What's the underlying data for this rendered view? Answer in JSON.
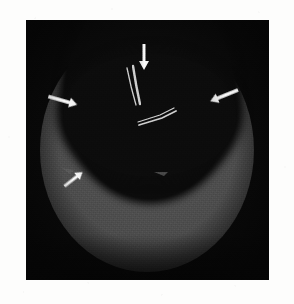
{
  "page": {
    "background_color": "#fdfdfc"
  },
  "figure": {
    "name": "cross-sectional-scan",
    "modality_appearance": "grayscale tomographic / ultrasound cross-section",
    "panel": {
      "x": 26,
      "y": 20,
      "width": 243,
      "height": 260,
      "background_color": "#090909",
      "border_color": "#000000"
    },
    "anatomy": {
      "outer_wall": {
        "label": "tube wall (bright annular band)",
        "color": "#4e4e4e",
        "highlight_color": "#565656"
      },
      "lumen": {
        "label": "central cavity (anechoic lumen)",
        "color": "#0b0b0b"
      },
      "vignette_color": "#050505"
    },
    "devices": [
      {
        "name": "guidewire-vertical",
        "color": "#cfcfcf",
        "points": "127,68 131,88 136,104",
        "stroke_width": 1.4
      },
      {
        "name": "guidewire-shadow",
        "color": "#1c1c1c",
        "points": "133,66 137,88 140,104",
        "stroke_width": 2.2
      },
      {
        "name": "device-horizontal",
        "color": "#b8b8b8",
        "points": "111,102 128,97 141,93",
        "stroke_width": 1.3
      }
    ],
    "arrows": [
      {
        "name": "arrow-top",
        "direction": "down",
        "tip_x": 143,
        "tip_y": 68,
        "tail_x": 143,
        "tail_y": 44,
        "color": "#f2f2f2",
        "points_at": "outer boundary of upper wall band"
      },
      {
        "name": "arrow-left",
        "direction": "right-down",
        "tip_x": 76,
        "tip_y": 105,
        "tail_x": 48,
        "tail_y": 96,
        "color": "#f2f2f2",
        "points_at": "left edge of annular wall"
      },
      {
        "name": "arrow-right",
        "direction": "left-down",
        "tip_x": 203,
        "tip_y": 101,
        "tail_x": 236,
        "tail_y": 87,
        "color": "#f2f2f2",
        "points_at": "right edge of annular wall"
      },
      {
        "name": "arrow-bottom-left",
        "direction": "up-right",
        "tip_x": 87,
        "tip_y": 169,
        "tail_x": 66,
        "tail_y": 185,
        "color": "#f2f2f2",
        "points_at": "inner edge of lower wall band"
      }
    ],
    "landmarks": [
      {
        "name": "notch-bottom-right",
        "x": 160,
        "y": 172,
        "color": "#6e6e6e",
        "label": "bright notch on lower wall inner margin"
      },
      {
        "name": "notch-left-edge",
        "x": 64,
        "y": 170,
        "color": "#7a7a7a",
        "label": "bright step on left wall margin"
      }
    ],
    "caption": ""
  }
}
